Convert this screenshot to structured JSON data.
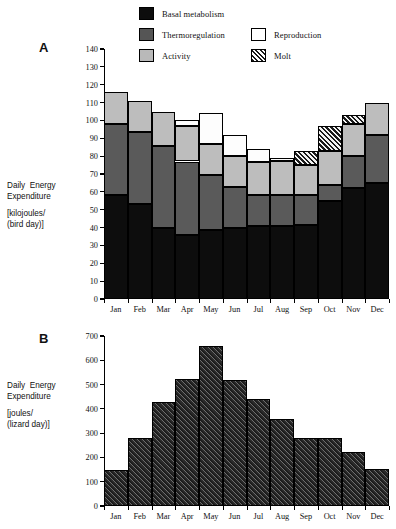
{
  "legend": {
    "items": [
      {
        "label": "Basal metabolism",
        "key": "basal",
        "swatch": "basal-swatch"
      },
      {
        "label": "Thermoregulation",
        "key": "thermo",
        "swatch": "thermoregulation-swatch"
      },
      {
        "label": "Activity",
        "key": "activity",
        "swatch": "activity-swatch"
      },
      {
        "label": "Reproduction",
        "key": "repro",
        "swatch": "reproduction-swatch"
      },
      {
        "label": "Molt",
        "key": "molt",
        "swatch": "molt-swatch"
      }
    ]
  },
  "panelA": {
    "letter": "A",
    "caption_line1": "Daily  Energy",
    "caption_line2": "Expenditure",
    "caption_line3": "[kilojoules/",
    "caption_line4": "(bird day)]"
  },
  "panelB": {
    "letter": "B",
    "caption_line1": "Daily  Energy",
    "caption_line2": "Expenditure",
    "caption_line3": "[joules/",
    "caption_line4": "(lizard day)]"
  },
  "chart_data": [
    {
      "type": "bar",
      "id": "panel-a",
      "title": "A",
      "stacked": true,
      "xlabel": "",
      "ylabel": "Daily Energy Expenditure [kilojoules/(bird day)]",
      "ylim": [
        0,
        140
      ],
      "ytick_step": 10,
      "yticks": [
        0,
        10,
        20,
        30,
        40,
        50,
        60,
        70,
        80,
        90,
        100,
        110,
        120,
        130,
        140
      ],
      "grid": false,
      "legend_position": "top",
      "categories": [
        "Jan",
        "Feb",
        "Mar",
        "Apr",
        "May",
        "Jun",
        "Jul",
        "Aug",
        "Sep",
        "Oct",
        "Nov",
        "Dec"
      ],
      "series": [
        {
          "name": "Basal metabolism",
          "color": "#0d0d0d",
          "values": [
            58,
            53,
            40,
            36,
            38.5,
            39.5,
            41,
            41,
            41.5,
            55,
            62,
            65
          ]
        },
        {
          "name": "Thermoregulation",
          "color": "#5a5a5a",
          "values": [
            40,
            40.5,
            45.5,
            41,
            31,
            23,
            17,
            17.5,
            16.5,
            9,
            18,
            27
          ]
        },
        {
          "name": "Activity",
          "color": "#bdbdbd",
          "values": [
            18,
            17.5,
            19.5,
            20,
            17.5,
            17.5,
            19,
            19,
            17,
            19,
            18,
            18
          ]
        },
        {
          "name": "Reproduction",
          "color": "#fdfdfd",
          "values": [
            0,
            0,
            0,
            3,
            17,
            12,
            7,
            1.5,
            0,
            0,
            0,
            0
          ]
        },
        {
          "name": "Molt",
          "color": "hatch",
          "values": [
            0,
            0,
            0,
            0,
            0,
            0,
            0,
            0,
            8,
            14,
            5,
            0
          ]
        }
      ],
      "totals": [
        116,
        111,
        105,
        100,
        104,
        92,
        84,
        79,
        83,
        97,
        103,
        110
      ]
    },
    {
      "type": "bar",
      "id": "panel-b",
      "title": "B",
      "stacked": false,
      "xlabel": "",
      "ylabel": "Daily Energy Expenditure [joules/(lizard day)]",
      "ylim": [
        0,
        700
      ],
      "ytick_step": 100,
      "yticks": [
        0,
        100,
        200,
        300,
        400,
        500,
        600,
        700
      ],
      "grid": false,
      "categories": [
        "Jan",
        "Feb",
        "Mar",
        "Apr",
        "May",
        "Jun",
        "Jul",
        "Aug",
        "Sep",
        "Oct",
        "Nov",
        "Dec"
      ],
      "values": [
        148,
        278,
        430,
        525,
        660,
        520,
        440,
        357,
        278,
        278,
        222,
        152
      ]
    }
  ]
}
